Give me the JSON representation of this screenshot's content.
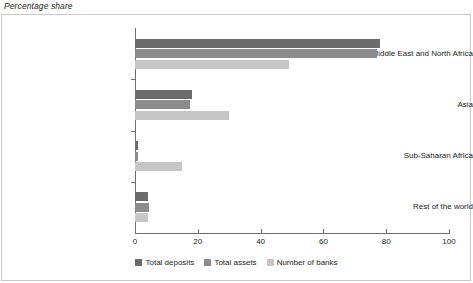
{
  "figure": {
    "title": "Percentage share"
  },
  "legend": {
    "items": [
      {
        "label": "Total deposits",
        "key": "deposits",
        "color": "#6b6b6b"
      },
      {
        "label": "Total assets",
        "key": "assets",
        "color": "#8c8c8c"
      },
      {
        "label": "Number of banks",
        "key": "banks",
        "color": "#c6c6c6"
      }
    ]
  },
  "chart_data": {
    "type": "bar",
    "orientation": "horizontal",
    "title": "Percentage share",
    "xlabel": "",
    "ylabel": "",
    "xlim": [
      0,
      100
    ],
    "xticks": [
      0,
      20,
      40,
      60,
      80,
      100
    ],
    "grid": false,
    "legend_position": "bottom-center",
    "categories": [
      "Middle East and North Africa",
      "Asia",
      "Sub-Saharan Africa",
      "Rest of the world"
    ],
    "series": [
      {
        "name": "Total deposits",
        "color": "#6b6b6b",
        "values": [
          78,
          18,
          1,
          4
        ]
      },
      {
        "name": "Total assets",
        "color": "#8c8c8c",
        "values": [
          77,
          17.5,
          1,
          4.5
        ]
      },
      {
        "name": "Number of banks",
        "color": "#c6c6c6",
        "values": [
          49,
          30,
          15,
          4
        ]
      }
    ]
  }
}
